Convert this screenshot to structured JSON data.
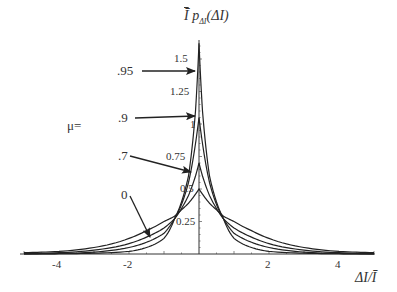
{
  "chart_data": {
    "type": "line",
    "xlabel": "ΔI/Ī",
    "ylabel": "Ī p_ΔI(ΔI)",
    "xlim": [
      -5,
      5
    ],
    "ylim": [
      0,
      1.65
    ],
    "x_ticks": [
      "-4",
      "-2",
      "2",
      "4"
    ],
    "y_ticks": [
      "0.25",
      "0.5",
      "0.75",
      "1",
      "1.25",
      "1.5"
    ],
    "grid": false,
    "legend_prefix": "μ=",
    "x": [
      -5,
      -4,
      -3,
      -2,
      -1.5,
      -1,
      -0.7,
      -0.5,
      -0.3,
      -0.1,
      0,
      0.1,
      0.3,
      0.5,
      0.7,
      1,
      1.5,
      2,
      3,
      4,
      5
    ],
    "series": [
      {
        "name": "0",
        "values": [
          0.01,
          0.02,
          0.05,
          0.12,
          0.18,
          0.25,
          0.29,
          0.34,
          0.39,
          0.46,
          0.5,
          0.46,
          0.39,
          0.34,
          0.29,
          0.25,
          0.18,
          0.12,
          0.05,
          0.02,
          0.01
        ]
      },
      {
        "name": ".7",
        "values": [
          0.003,
          0.01,
          0.03,
          0.08,
          0.13,
          0.2,
          0.27,
          0.35,
          0.45,
          0.6,
          0.7,
          0.6,
          0.45,
          0.35,
          0.27,
          0.2,
          0.13,
          0.08,
          0.03,
          0.01,
          0.003
        ]
      },
      {
        "name": ".9",
        "values": [
          0.001,
          0.004,
          0.015,
          0.05,
          0.09,
          0.16,
          0.27,
          0.38,
          0.55,
          0.85,
          1.05,
          0.85,
          0.55,
          0.38,
          0.27,
          0.16,
          0.09,
          0.05,
          0.015,
          0.004,
          0.001
        ]
      },
      {
        "name": ".95",
        "values": [
          0.0,
          0.002,
          0.006,
          0.02,
          0.05,
          0.12,
          0.27,
          0.4,
          0.6,
          1.1,
          1.62,
          1.1,
          0.6,
          0.4,
          0.27,
          0.12,
          0.05,
          0.02,
          0.006,
          0.002,
          0.0
        ]
      }
    ],
    "annotations": [
      {
        "text": ".95",
        "arrow_to_x": 0.0,
        "arrow_to_y": 1.3
      },
      {
        "text": ".9",
        "arrow_to_x": 0.0,
        "arrow_to_y": 1.05
      },
      {
        "text": ".7",
        "arrow_to_x": -0.1,
        "arrow_to_y": 0.69
      },
      {
        "text": "0",
        "arrow_to_x": -1.4,
        "arrow_to_y": 0.16
      }
    ]
  },
  "labels": {
    "title_bar": "Ī",
    "title_main": "p",
    "title_sub": "ΔI",
    "title_arg": "(ΔI)",
    "xlabel": "ΔI/Ī",
    "mu_prefix": "μ=",
    "y_ticks": [
      "0.25",
      "0.5",
      "0.75",
      "1",
      "1.25",
      "1.5"
    ],
    "x_ticks": [
      "-4",
      "-2",
      "2",
      "4"
    ],
    "series_labels": [
      ".95",
      ".9",
      ".7",
      "0"
    ]
  }
}
